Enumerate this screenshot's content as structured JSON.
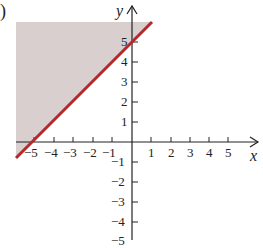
{
  "figure": {
    "part_marker": ")",
    "x_axis_label": "x",
    "y_axis_label": "y",
    "x_ticks": [
      {
        "value": -5,
        "label": "−5"
      },
      {
        "value": -4,
        "label": "−4"
      },
      {
        "value": -3,
        "label": "−3"
      },
      {
        "value": -2,
        "label": "−2"
      },
      {
        "value": -1,
        "label": "−1"
      },
      {
        "value": 1,
        "label": "1"
      },
      {
        "value": 2,
        "label": "2"
      },
      {
        "value": 3,
        "label": "3"
      },
      {
        "value": 4,
        "label": "4"
      },
      {
        "value": 5,
        "label": "5"
      }
    ],
    "y_ticks": [
      {
        "value": 5,
        "label": "5"
      },
      {
        "value": 4,
        "label": "4"
      },
      {
        "value": 3,
        "label": "3"
      },
      {
        "value": 2,
        "label": "2"
      },
      {
        "value": 1,
        "label": "1"
      },
      {
        "value": -1,
        "label": "−1"
      },
      {
        "value": -2,
        "label": "−2"
      },
      {
        "value": -3,
        "label": "−3"
      },
      {
        "value": -4,
        "label": "−4"
      },
      {
        "value": -5,
        "label": "−5"
      }
    ],
    "boundary_line": "y = x + 5",
    "shaded_region": "y ≥ x + 5",
    "colors": {
      "line": "#b5282b",
      "shade": "#d9cfcf",
      "axis": "#222222"
    }
  }
}
